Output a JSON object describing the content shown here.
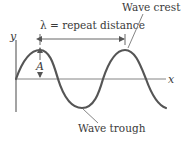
{
  "diagram": {
    "labels": {
      "wavelength": "λ = repeat distance",
      "crest": "Wave crest",
      "trough": "Wave trough",
      "amplitude": "A",
      "x_axis": "x",
      "y_axis": "y"
    },
    "colors": {
      "wave": "#555555",
      "axis": "#666666",
      "text": "#3a3a3a"
    },
    "wave": {
      "type": "sine",
      "wavelength_px": 85,
      "amplitude_px": 29,
      "cycles_shown": 1.75
    }
  }
}
